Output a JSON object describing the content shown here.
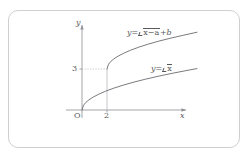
{
  "card": {
    "name": "figure-card"
  },
  "axes": {
    "x_label": "x",
    "y_label": "y",
    "origin_label": "O",
    "x_ticks": [
      "2"
    ],
    "y_ticks": [
      "3"
    ]
  },
  "annotations": {
    "shifted_curve_label_prefix": "y=",
    "shifted_curve_radicand": "x−a",
    "shifted_curve_suffix": "+b",
    "base_curve_label_prefix": "y=",
    "base_curve_radicand": "x"
  },
  "colors": {
    "ink": "#58585c",
    "curve": "#6b6b70",
    "axis": "#8e8e93",
    "guide": "#b8b8bd",
    "card_border": "#cfcfcf",
    "background": "#ffffff"
  },
  "chart_data": {
    "type": "line",
    "title": "",
    "xlabel": "x",
    "ylabel": "y",
    "xlim": [
      -0.6,
      9.5
    ],
    "ylim": [
      -0.8,
      6.2
    ],
    "grid": false,
    "legend": "inline-annotations",
    "annotations": [
      {
        "text": "y=√(x−a)+b",
        "x": 5.2,
        "y": 5.3
      },
      {
        "text": "y=√x",
        "x": 6.2,
        "y": 3.0
      }
    ],
    "markers": [
      {
        "label": "O",
        "x": 0,
        "y": 0
      },
      {
        "label": "2",
        "x": 2,
        "y": 0
      },
      {
        "label": "3",
        "x": 0,
        "y": 3
      }
    ],
    "guides": [
      {
        "type": "dotted-horizontal",
        "from": [
          0,
          3
        ],
        "to": [
          2,
          3
        ]
      },
      {
        "type": "solid-vertical",
        "from": [
          2,
          0
        ],
        "to": [
          2,
          3
        ]
      }
    ],
    "series": [
      {
        "name": "y=√x",
        "domain_start": 0,
        "points": [
          [
            0.0,
            0.0
          ],
          [
            0.12,
            0.35
          ],
          [
            0.3,
            0.55
          ],
          [
            0.55,
            0.74
          ],
          [
            0.9,
            0.95
          ],
          [
            1.35,
            1.16
          ],
          [
            1.9,
            1.38
          ],
          [
            2.55,
            1.6
          ],
          [
            3.3,
            1.82
          ],
          [
            4.15,
            2.04
          ],
          [
            5.1,
            2.26
          ],
          [
            6.15,
            2.48
          ],
          [
            7.3,
            2.7
          ],
          [
            8.55,
            2.92
          ],
          [
            9.2,
            3.03
          ]
        ]
      },
      {
        "name": "y=√(x−a)+b",
        "domain_start": 2,
        "anchor_point": [
          2,
          3
        ],
        "points": [
          [
            2.0,
            3.0
          ],
          [
            2.12,
            3.35
          ],
          [
            2.3,
            3.55
          ],
          [
            2.55,
            3.74
          ],
          [
            2.9,
            3.95
          ],
          [
            3.35,
            4.16
          ],
          [
            3.9,
            4.38
          ],
          [
            4.55,
            4.6
          ],
          [
            5.3,
            4.82
          ],
          [
            6.15,
            5.04
          ],
          [
            7.1,
            5.26
          ],
          [
            8.15,
            5.48
          ],
          [
            9.2,
            5.69
          ]
        ]
      }
    ]
  }
}
